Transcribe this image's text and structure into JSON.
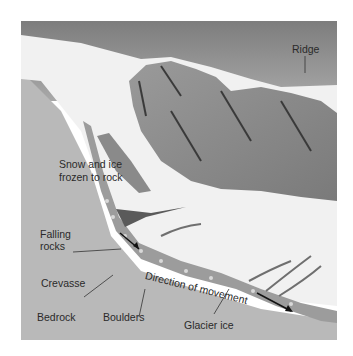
{
  "figure": {
    "labels": {
      "ridge": "Ridge",
      "snow_ice_line1": "Snow and ice",
      "snow_ice_line2": "frozen to rock",
      "falling_rocks_line1": "Falling",
      "falling_rocks_line2": "rocks",
      "crevasse": "Crevasse",
      "bedrock": "Bedrock",
      "boulders": "Boulders",
      "glacier_ice": "Glacier ice",
      "direction": "Direction of movement"
    },
    "colors": {
      "sky": "#8a8a8a",
      "snow": "#f2f2f2",
      "rock": "#8c8c8c",
      "bedrock": "#b8b8b8",
      "glacier_band": "#9a9a9a",
      "text": "#2a2a2a"
    }
  }
}
